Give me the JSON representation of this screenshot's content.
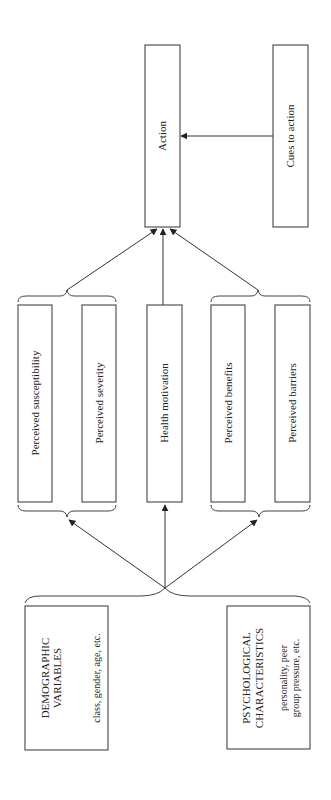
{
  "diagram": {
    "nodes": {
      "action": {
        "label": "Action"
      },
      "cues": {
        "label": "Cues to action"
      },
      "susceptibility": {
        "label": "Perceived susceptibility"
      },
      "severity": {
        "label": "Perceived severity"
      },
      "motivation": {
        "label": "Health motivation"
      },
      "benefits": {
        "label": "Perceived benefits"
      },
      "barriers": {
        "label": "Perceived barriers"
      },
      "demographic": {
        "title_line1": "DEMOGRAPHIC",
        "title_line2": "VARIABLES",
        "detail_line1": "class, gender, age, etc."
      },
      "psychological": {
        "title_line1": "PSYCHOLOGICAL",
        "title_line2": "CHARACTERISTICS",
        "detail_line1": "personality, peer",
        "detail_line2": "group pressure, etc."
      }
    },
    "edges": [
      {
        "from": "cues",
        "to": "action"
      },
      {
        "from": "threat_group",
        "to": "action"
      },
      {
        "from": "motivation",
        "to": "action"
      },
      {
        "from": "benefit_barrier_group",
        "to": "action"
      },
      {
        "from": "modifying_factors",
        "to": "threat_group"
      },
      {
        "from": "modifying_factors",
        "to": "motivation"
      },
      {
        "from": "modifying_factors",
        "to": "benefit_barrier_group"
      }
    ],
    "colors": {
      "stroke": "#444444",
      "background": "#ffffff"
    }
  }
}
